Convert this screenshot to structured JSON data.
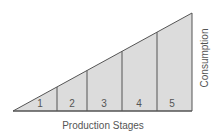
{
  "diagram": {
    "stages": [
      "1",
      "2",
      "3",
      "4",
      "5"
    ],
    "x_label": "Production Stages",
    "y_label": "Consumption",
    "fill_color": "#dcdcdc",
    "line_color": "#555555"
  }
}
